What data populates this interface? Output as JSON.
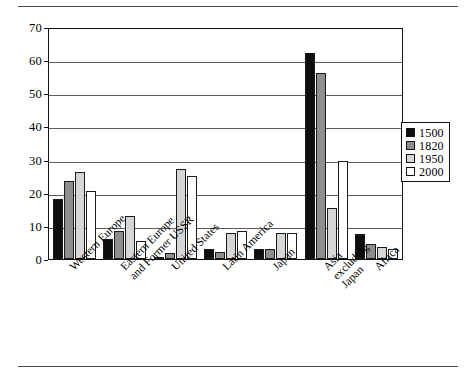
{
  "figure": {
    "top_rule": "horizontal-rule",
    "bottom_rule": "horizontal-rule"
  },
  "legend": {
    "position": "right",
    "entries": [
      {
        "label": "1500",
        "color": "#100f0f"
      },
      {
        "label": "1820",
        "color": "#8e8e8e"
      },
      {
        "label": "1950",
        "color": "#d6d6d6"
      },
      {
        "label": "2000",
        "color": "#ffffff"
      }
    ]
  },
  "axis": {
    "y_ticks": [
      "0",
      "10",
      "20",
      "30",
      "40",
      "50",
      "60",
      "70"
    ],
    "x_labels": [
      {
        "line1": "Western Europe",
        "line2": ""
      },
      {
        "line1": "Eastern Europe",
        "line2": "and Former USSR"
      },
      {
        "line1": "United States",
        "line2": ""
      },
      {
        "line1": "Latin America",
        "line2": ""
      },
      {
        "line1": "Japan",
        "line2": ""
      },
      {
        "line1": "Asia",
        "line2": "excluding",
        "line3": "Japan"
      },
      {
        "line1": "Africa",
        "line2": ""
      }
    ]
  },
  "chart_data": {
    "type": "bar",
    "title": "",
    "subtitle": "",
    "xlabel": "",
    "ylabel": "",
    "ylim": [
      0,
      70
    ],
    "ytick_step": 10,
    "grid": true,
    "legend_position": "right",
    "categories": [
      "Western Europe",
      "Eastern Europe and Former USSR",
      "United States",
      "Latin America",
      "Japan",
      "Asia excluding Japan",
      "Africa"
    ],
    "series": [
      {
        "name": "1500",
        "color": "#100f0f",
        "values": [
          18.0,
          6.0,
          0.3,
          2.9,
          3.1,
          62.1,
          7.4
        ]
      },
      {
        "name": "1820",
        "color": "#8e8e8e",
        "values": [
          23.6,
          8.6,
          1.8,
          2.1,
          3.0,
          56.2,
          4.5
        ]
      },
      {
        "name": "1950",
        "color": "#d6d6d6",
        "values": [
          26.3,
          13.1,
          27.3,
          7.8,
          7.7,
          15.5,
          3.6
        ]
      },
      {
        "name": "2000",
        "color": "#ffffff",
        "values": [
          20.6,
          5.4,
          25.1,
          8.6,
          7.8,
          29.5,
          3.0
        ]
      }
    ]
  }
}
